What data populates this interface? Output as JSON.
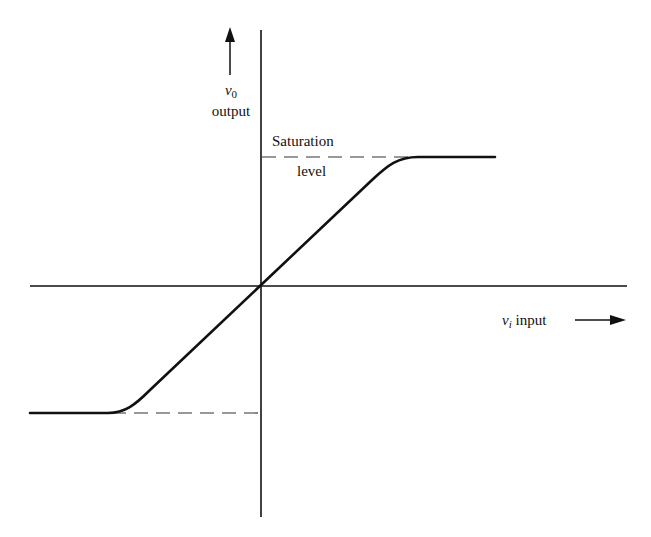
{
  "diagram": {
    "type": "transfer-characteristic",
    "y_axis": {
      "symbol": "v",
      "subscript": "0",
      "label": "output",
      "arrow_direction": "up"
    },
    "x_axis": {
      "symbol": "v",
      "subscript": "i",
      "label": "input",
      "arrow_direction": "right"
    },
    "annotations": {
      "saturation_line1": "Saturation",
      "saturation_line2": "level"
    },
    "curve": {
      "description": "linear through origin, saturating at positive and negative levels",
      "positive_saturation": true,
      "negative_saturation": true
    },
    "colors": {
      "line": "#111111",
      "dashed": "#333333",
      "background": "#ffffff"
    }
  }
}
